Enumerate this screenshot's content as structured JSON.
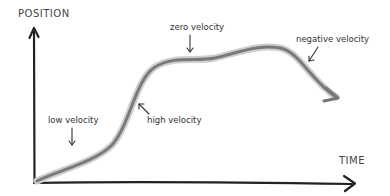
{
  "diagram": {
    "type": "position-time sketch",
    "axes": {
      "y_label": "POSITION",
      "x_label": "TIME"
    },
    "annotations": [
      {
        "id": "low",
        "text": "low velocity"
      },
      {
        "id": "high",
        "text": "high velocity"
      },
      {
        "id": "zero",
        "text": "zero velocity"
      },
      {
        "id": "negative",
        "text": "negative velocity"
      }
    ],
    "colors": {
      "axis": "#222222",
      "curve": "#7a7a7a",
      "curve_shadow": "#c8c8c8",
      "text": "#333333",
      "background": "#ffffff"
    }
  }
}
